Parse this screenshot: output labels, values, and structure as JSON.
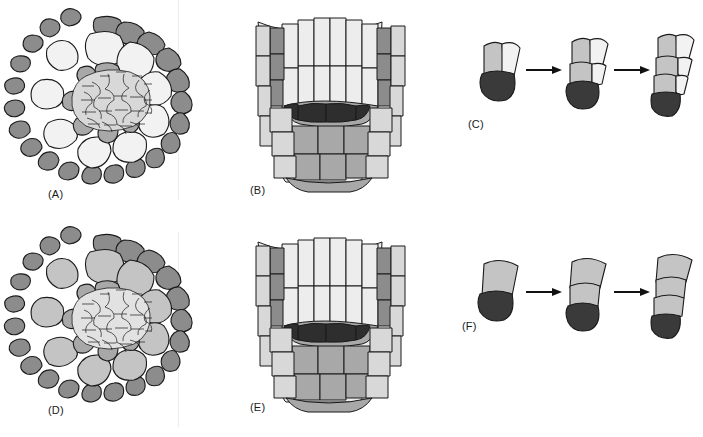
{
  "figure": {
    "background_color": "#ffffff",
    "width": 703,
    "height": 437,
    "rows": 2,
    "columns": 3
  },
  "palette": {
    "outline": "#1a1a1a",
    "epidermis_dark_gray": "#8c8c8c",
    "cortex_light_gray": "#c4c4c4",
    "cortex_white": "#f2f2f2",
    "stele_light": "#d8d8d8",
    "quiescent_center_black": "#2e2e2e",
    "mid_gray": "#a8a8a8",
    "pale": "#ededed",
    "arrow": "#111111",
    "label_text": "#1a1a1a"
  },
  "panels": [
    {
      "id": "A",
      "label": "(A)",
      "type": "cross-section",
      "row": 1,
      "column": 1,
      "label_x": 48,
      "label_y": 188,
      "description": "Transverse section of root apex: ring of dark gray epidermal cells surrounding large pale cortical cells and a central stele of many small cells",
      "cell_rings": [
        {
          "name": "epidermis",
          "fill": "#8c8c8c",
          "count": 30
        },
        {
          "name": "cortex",
          "fill": "#f2f2f2",
          "count": 8
        },
        {
          "name": "endodermis",
          "fill": "#a8a8a8",
          "count": 8
        },
        {
          "name": "stele",
          "fill": "#d8d8d8",
          "count": 60
        }
      ]
    },
    {
      "id": "B",
      "label": "(B)",
      "type": "longitudinal-section",
      "row": 1,
      "column": 2,
      "label_x": 250,
      "label_y": 186,
      "description": "Median longitudinal section of root tip showing vertical cell files, flanking dark gray files and a black quiescent centre above the columella",
      "features": [
        {
          "name": "cell-files",
          "fill": "#ededed"
        },
        {
          "name": "flanking-files",
          "fill": "#8c8c8c"
        },
        {
          "name": "quiescent-centre",
          "fill": "#2e2e2e"
        },
        {
          "name": "columella",
          "fill": "#a8a8a8"
        }
      ]
    },
    {
      "id": "C",
      "label": "(C)",
      "type": "division-sequence",
      "row": 1,
      "column": 3,
      "label_x": 470,
      "label_y": 120,
      "description": "Three-stage sequence of stem cell divisions; initial cell already divided into two daughters above a dark columella cell",
      "stages": 3,
      "arrows": 2,
      "initial_state": "divided",
      "cap_fill": "#3a3a3a",
      "cell_fills": [
        "#c4c4c4",
        "#f2f2f2"
      ]
    },
    {
      "id": "D",
      "label": "(D)",
      "type": "cross-section",
      "row": 2,
      "column": 1,
      "label_x": 48,
      "label_y": 406,
      "description": "Transverse section as in (A) but with uniformly gray cortical cells indicating altered cell identity",
      "cell_rings": [
        {
          "name": "epidermis",
          "fill": "#8c8c8c",
          "count": 30
        },
        {
          "name": "cortex",
          "fill": "#c4c4c4",
          "count": 8
        },
        {
          "name": "endodermis",
          "fill": "#a8a8a8",
          "count": 8
        },
        {
          "name": "stele",
          "fill": "#d8d8d8",
          "count": 60
        }
      ]
    },
    {
      "id": "E",
      "label": "(E)",
      "type": "longitudinal-section",
      "row": 2,
      "column": 2,
      "label_x": 250,
      "label_y": 403,
      "description": "Median longitudinal section as in (B) with broader gray regions in the basal root body",
      "features": [
        {
          "name": "cell-files",
          "fill": "#ededed"
        },
        {
          "name": "flanking-files",
          "fill": "#8c8c8c"
        },
        {
          "name": "quiescent-centre",
          "fill": "#2e2e2e"
        },
        {
          "name": "columella",
          "fill": "#a8a8a8"
        }
      ]
    },
    {
      "id": "F",
      "label": "(F)",
      "type": "division-sequence",
      "row": 2,
      "column": 3,
      "label_x": 462,
      "label_y": 325,
      "description": "Three-stage sequence beginning with a single undivided gray stem cell above a dark columella cell",
      "stages": 3,
      "arrows": 2,
      "initial_state": "undivided",
      "cap_fill": "#3a3a3a",
      "cell_fills": [
        "#c4c4c4"
      ]
    }
  ]
}
